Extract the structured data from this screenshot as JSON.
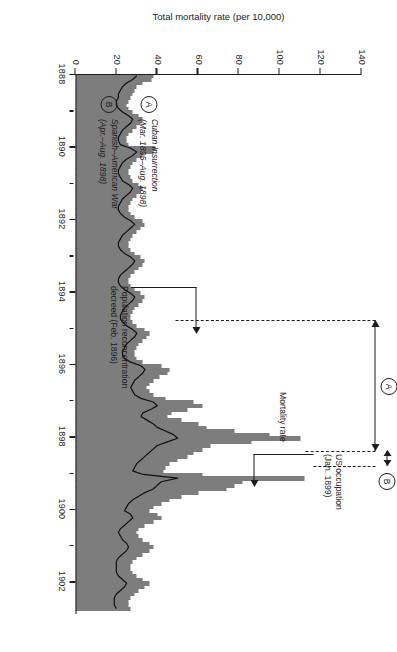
{
  "chart_data": {
    "type": "bar",
    "title": "",
    "subtitle": "",
    "xlabel": "",
    "ylabel": "Total mortality rate (per 10,000)",
    "xlim": [
      1888,
      1902.9
    ],
    "ylim": [
      0,
      140
    ],
    "grid": false,
    "legend_position": "inside-left",
    "x_tick_labels": [
      "1888",
      "1890",
      "1892",
      "1894",
      "1896",
      "1898",
      "1900",
      "1902"
    ],
    "x_tick_values": [
      1888,
      1890,
      1892,
      1894,
      1896,
      1898,
      1900,
      1902
    ],
    "x_minor_tick_values": [
      1889,
      1891,
      1893,
      1895,
      1897,
      1899,
      1901
    ],
    "y_tick_labels": [
      "0",
      "20",
      "40",
      "60",
      "80",
      "100",
      "120",
      "140"
    ],
    "y_tick_values": [
      0,
      20,
      40,
      60,
      80,
      100,
      120,
      140
    ],
    "series": [
      {
        "name": "Total mortality rate",
        "type": "bar",
        "color": "#7d7d7d",
        "x": [
          1888.0,
          1888.1,
          1888.2,
          1888.3,
          1888.4,
          1888.5,
          1888.6,
          1888.7,
          1888.8,
          1888.9,
          1889.0,
          1889.1,
          1889.2,
          1889.3,
          1889.4,
          1889.5,
          1889.6,
          1889.7,
          1889.8,
          1889.9,
          1890.0,
          1890.1,
          1890.2,
          1890.3,
          1890.4,
          1890.5,
          1890.6,
          1890.7,
          1890.8,
          1890.9,
          1891.0,
          1891.1,
          1891.2,
          1891.3,
          1891.4,
          1891.5,
          1891.6,
          1891.7,
          1891.8,
          1891.9,
          1892.0,
          1892.1,
          1892.2,
          1892.3,
          1892.4,
          1892.5,
          1892.6,
          1892.7,
          1892.8,
          1892.9,
          1893.0,
          1893.1,
          1893.2,
          1893.3,
          1893.4,
          1893.5,
          1893.6,
          1893.7,
          1893.8,
          1893.9,
          1894.0,
          1894.1,
          1894.2,
          1894.3,
          1894.4,
          1894.5,
          1894.6,
          1894.7,
          1894.8,
          1894.9,
          1895.0,
          1895.1,
          1895.2,
          1895.3,
          1895.4,
          1895.5,
          1895.6,
          1895.7,
          1895.8,
          1895.9,
          1896.0,
          1896.1,
          1896.2,
          1896.3,
          1896.4,
          1896.5,
          1896.6,
          1896.7,
          1896.8,
          1896.9,
          1897.0,
          1897.1,
          1897.2,
          1897.3,
          1897.4,
          1897.5,
          1897.6,
          1897.7,
          1897.8,
          1897.9,
          1898.0,
          1898.1,
          1898.2,
          1898.3,
          1898.4,
          1898.5,
          1898.6,
          1898.7,
          1898.8,
          1898.9,
          1899.0,
          1899.1,
          1899.2,
          1899.3,
          1899.4,
          1899.5,
          1899.6,
          1899.7,
          1899.8,
          1899.9,
          1900.0,
          1900.1,
          1900.2,
          1900.3,
          1900.4,
          1900.5,
          1900.6,
          1900.7,
          1900.8,
          1900.9,
          1901.0,
          1901.1,
          1901.2,
          1901.3,
          1901.4,
          1901.5,
          1901.6,
          1901.7,
          1901.8,
          1901.9,
          1902.0,
          1902.1,
          1902.2,
          1902.3,
          1902.4,
          1902.5,
          1902.6,
          1902.7
        ],
        "values": [
          38,
          37,
          33,
          30,
          29,
          28,
          27,
          26,
          25,
          26,
          28,
          31,
          33,
          32,
          30,
          28,
          26,
          25,
          25,
          26,
          39,
          38,
          33,
          30,
          28,
          27,
          26,
          26,
          27,
          28,
          31,
          33,
          32,
          30,
          28,
          27,
          26,
          26,
          27,
          29,
          33,
          34,
          32,
          30,
          28,
          27,
          26,
          26,
          27,
          29,
          32,
          34,
          33,
          31,
          29,
          27,
          26,
          26,
          27,
          29,
          32,
          34,
          33,
          31,
          29,
          28,
          27,
          27,
          28,
          30,
          34,
          36,
          35,
          33,
          31,
          30,
          29,
          29,
          30,
          33,
          42,
          46,
          45,
          41,
          38,
          36,
          35,
          36,
          38,
          44,
          58,
          62,
          55,
          47,
          45,
          52,
          60,
          64,
          78,
          95,
          110,
          86,
          66,
          62,
          58,
          55,
          50,
          46,
          44,
          43,
          62,
          112,
          82,
          78,
          74,
          60,
          52,
          46,
          42,
          38,
          36,
          40,
          42,
          38,
          34,
          31,
          30,
          31,
          33,
          36,
          38,
          36,
          33,
          30,
          28,
          27,
          27,
          28,
          30,
          33,
          36,
          34,
          31,
          29,
          27,
          26,
          26,
          27
        ]
      },
      {
        "name": "Mortality rate (area under line)",
        "type": "area",
        "color": "#d4d4d4",
        "description": "Light grey shaded background area beneath the black mortality-rate line"
      },
      {
        "name": "Mortality rate",
        "type": "line",
        "color": "#101010",
        "label_text": "Mortality rate",
        "values": [
          30,
          28,
          25,
          23,
          22,
          21,
          21,
          20,
          20,
          21,
          23,
          26,
          28,
          27,
          25,
          23,
          22,
          21,
          21,
          22,
          27,
          30,
          28,
          25,
          23,
          22,
          21,
          21,
          22,
          23,
          26,
          28,
          27,
          25,
          23,
          22,
          21,
          21,
          22,
          24,
          27,
          29,
          27,
          25,
          23,
          22,
          21,
          21,
          22,
          24,
          27,
          29,
          28,
          26,
          24,
          22,
          21,
          21,
          22,
          24,
          27,
          29,
          28,
          26,
          24,
          23,
          22,
          22,
          23,
          25,
          28,
          30,
          29,
          27,
          25,
          24,
          23,
          23,
          24,
          27,
          32,
          34,
          33,
          31,
          29,
          28,
          27,
          28,
          29,
          32,
          38,
          40,
          37,
          33,
          32,
          35,
          38,
          40,
          44,
          48,
          50,
          45,
          40,
          38,
          36,
          34,
          32,
          30,
          29,
          28,
          33,
          50,
          42,
          40,
          38,
          34,
          31,
          28,
          26,
          25,
          24,
          27,
          28,
          26,
          24,
          22,
          21,
          22,
          23,
          25,
          26,
          25,
          23,
          21,
          20,
          20,
          20,
          20,
          21,
          23,
          25,
          24,
          22,
          20,
          19,
          19,
          19,
          20
        ]
      }
    ],
    "annotations": [
      {
        "id": "us-occupation",
        "text_line1": "US occupation",
        "text_line2": "(Jan. 1899)",
        "points_to_year": 1899.0
      },
      {
        "id": "mortality-rate-label",
        "text": "Mortality rate"
      },
      {
        "id": "reconcentration",
        "text_line1": "Population reconcentration",
        "text_line2": "decreed (Feb. 1896)",
        "points_to_year": 1896.1
      },
      {
        "id": "span-A",
        "marker": "A",
        "from_year": 1894.6,
        "to_year": 1898.2
      },
      {
        "id": "span-B",
        "marker": "B",
        "from_year": 1898.25,
        "to_year": 1898.65
      }
    ]
  },
  "legend": {
    "items": [
      {
        "marker": "A",
        "line1": "Cuban Insurrection",
        "line2": "(Mar. 1895–Aug. 1898)"
      },
      {
        "marker": "B",
        "line1": "Spanish–American War",
        "line2": "(Apr.–Aug. 1898)"
      }
    ]
  },
  "colors": {
    "bar": "#7d7d7d",
    "area": "#d4d4d4",
    "line": "#101010",
    "axis": "#1d1d1d",
    "background": "#ffffff"
  }
}
